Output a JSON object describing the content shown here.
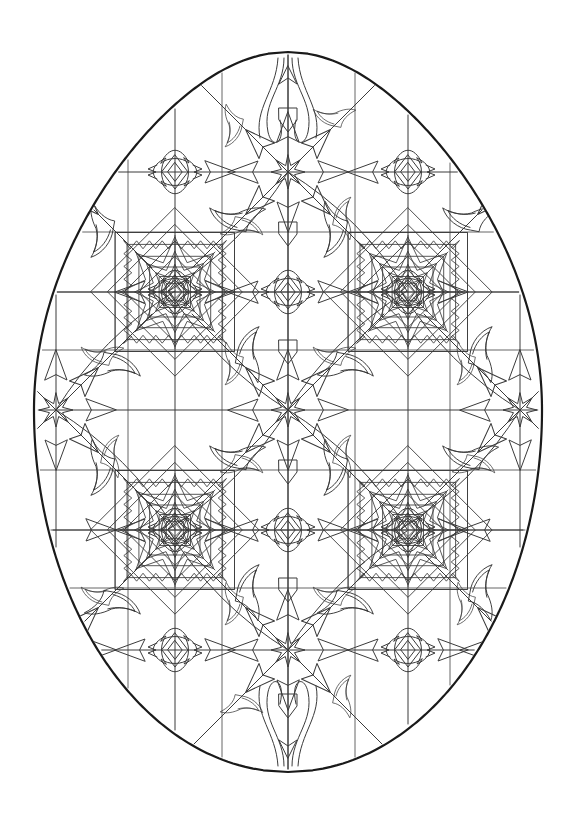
{
  "page": {
    "kind": "coloring-page",
    "title": "Decorated Easter Egg Coloring Page",
    "background_color": "#ffffff",
    "canvas": {
      "width": 582,
      "height": 819
    }
  },
  "artwork": {
    "subject": "easter-egg",
    "style": "islamic-geometric-tessellation",
    "outline_color": "#1a1a1a",
    "outline_width": 2.2,
    "detail_color": "#3a3a3a",
    "detail_width": 1.0,
    "grid_color": "#555555",
    "grid_width": 0.9,
    "fill": "none",
    "egg": {
      "center_x": 288,
      "top_y": 52,
      "bottom_y": 772,
      "left_x": 34,
      "right_x": 543,
      "half_width": 254,
      "upper_height": 358,
      "lower_height": 362,
      "taper": 0.78
    },
    "lattice": {
      "columns_x": [
        56,
        175,
        288,
        408,
        520
      ],
      "rows_y": [
        172,
        292,
        410,
        530,
        650
      ],
      "grid_lines_vertical_x": [
        128,
        222,
        355,
        450
      ],
      "grid_lines_horizontal_y": [
        232,
        292,
        350,
        470,
        530,
        588
      ],
      "spacing_x": 119,
      "spacing_y": 119
    },
    "motifs": [
      {
        "name": "eight-point-star-node",
        "count": 9,
        "points": 8,
        "outer_radius": 17,
        "inner_radius": 7,
        "positions": [
          [
            288,
            172
          ],
          [
            56,
            410
          ],
          [
            288,
            410
          ],
          [
            520,
            410
          ],
          [
            288,
            650
          ],
          [
            56,
            172
          ],
          [
            520,
            172
          ],
          [
            56,
            650
          ],
          [
            520,
            650
          ]
        ]
      },
      {
        "name": "diamond-rosette-node",
        "count": 8,
        "petals": 4,
        "diamond_half_width": 13,
        "diamond_half_height": 17,
        "positions": [
          [
            175,
            172
          ],
          [
            408,
            172
          ],
          [
            175,
            292
          ],
          [
            408,
            292
          ],
          [
            288,
            292
          ],
          [
            175,
            530
          ],
          [
            408,
            530
          ],
          [
            288,
            530
          ],
          [
            175,
            650
          ],
          [
            408,
            650
          ],
          [
            56,
            530
          ],
          [
            520,
            530
          ]
        ]
      },
      {
        "name": "square-star-rosette-panel",
        "count": 4,
        "size": 119,
        "nested_rings": 4,
        "positions": [
          [
            175,
            292
          ],
          [
            408,
            292
          ],
          [
            175,
            530
          ],
          [
            408,
            530
          ]
        ]
      },
      {
        "name": "arrowhead-spoke",
        "description": "tapered arrowhead pointing toward each star node along the lattice axes",
        "length": 30,
        "half_width": 11
      },
      {
        "name": "curved-leaf-flourish",
        "description": "S-curved tapering leaf filling each lattice cell corner",
        "count": 32
      }
    ],
    "palette": {
      "stroke_dark": "#1a1a1a",
      "stroke_mid": "#3a3a3a",
      "stroke_light": "#5a5a5a",
      "paper": "#ffffff"
    }
  }
}
